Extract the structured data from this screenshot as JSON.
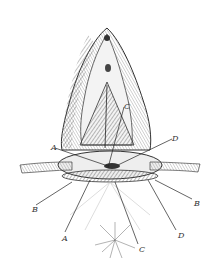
{
  "figure": {
    "kind": "anatomical engraving",
    "labels": [
      {
        "text": "C",
        "x": 124,
        "y": 103
      },
      {
        "text": "A",
        "x": 51,
        "y": 144
      },
      {
        "text": "D",
        "x": 172,
        "y": 135
      },
      {
        "text": "B",
        "x": 32,
        "y": 206
      },
      {
        "text": "B",
        "x": 194,
        "y": 200
      },
      {
        "text": "A",
        "x": 62,
        "y": 235
      },
      {
        "text": "C",
        "x": 139,
        "y": 246
      },
      {
        "text": "D",
        "x": 178,
        "y": 232
      }
    ]
  }
}
